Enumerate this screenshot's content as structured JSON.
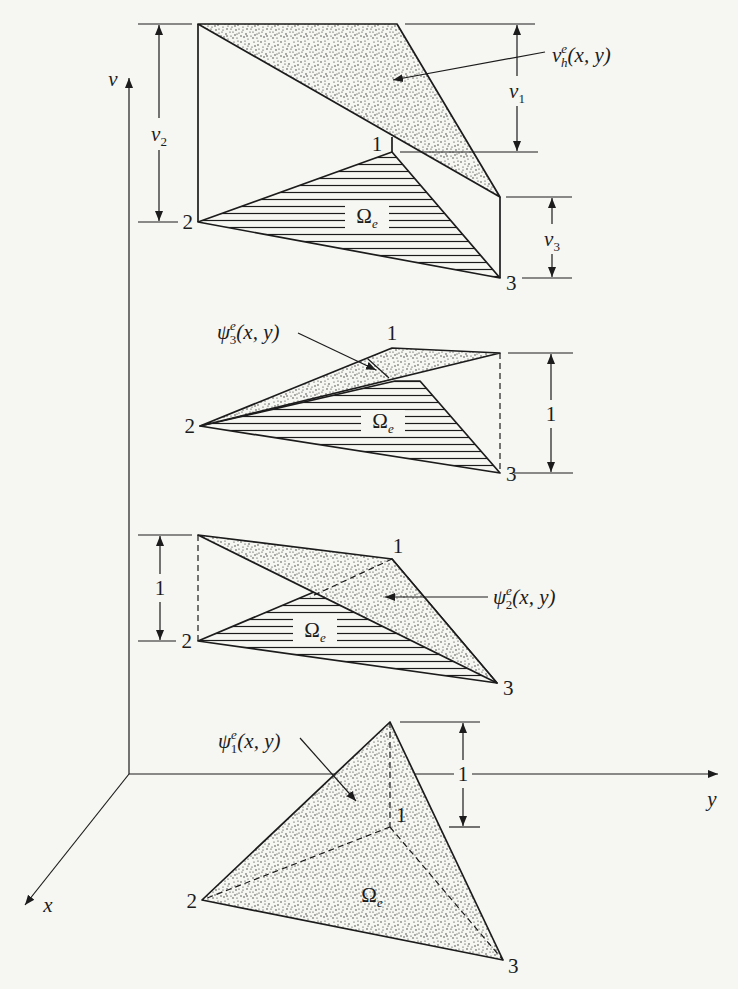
{
  "colors": {
    "background": "#f6f6f2",
    "ink": "#1c1c1c"
  },
  "axes": {
    "vertical_label": "v",
    "x_label": "x",
    "y_label": "y"
  },
  "panels": [
    {
      "name": "interpolated-solution",
      "function_label": {
        "base": "v",
        "sup": "e",
        "sub": "h",
        "args": "(x, y)"
      },
      "nodes": {
        "n1": "1",
        "n2": "2",
        "n3": "3"
      },
      "domain_label": {
        "base": "Ω",
        "sub": "e"
      },
      "dimensions": {
        "d1": {
          "base": "v",
          "sub": "1"
        },
        "d2": {
          "base": "v",
          "sub": "2"
        },
        "d3": {
          "base": "v",
          "sub": "3"
        }
      }
    },
    {
      "name": "shape-function-3",
      "function_label": {
        "base": "ψ",
        "sup": "e",
        "sub": "3",
        "args": "(x, y)"
      },
      "nodes": {
        "n1": "1",
        "n2": "2",
        "n3": "3"
      },
      "domain_label": {
        "base": "Ω",
        "sub": "e"
      },
      "height_label": "1"
    },
    {
      "name": "shape-function-2",
      "function_label": {
        "base": "ψ",
        "sup": "e",
        "sub": "2",
        "args": "(x, y)"
      },
      "nodes": {
        "n1": "1",
        "n2": "2",
        "n3": "3"
      },
      "domain_label": {
        "base": "Ω",
        "sub": "e"
      },
      "height_label": "1"
    },
    {
      "name": "shape-function-1",
      "function_label": {
        "base": "ψ",
        "sup": "e",
        "sub": "1",
        "args": "(x, y)"
      },
      "nodes": {
        "n1": "1",
        "n2": "2",
        "n3": "3"
      },
      "domain_label": {
        "base": "Ω",
        "sub": "e"
      },
      "height_label": "1"
    }
  ]
}
